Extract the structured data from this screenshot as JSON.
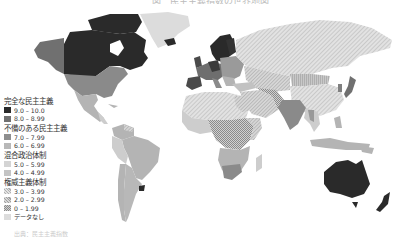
{
  "map": {
    "title": "図　民主主義指数の世界地図",
    "footer": "出典：民主主義指数",
    "colors": {
      "full_9_10": "#2a2a2a",
      "full_8_899": "#6e6e6e",
      "flawed_7_799": "#8e8e8e",
      "flawed_6_699": "#b4b4b4",
      "hybrid_5_599": "#cdcdcd",
      "hybrid_4_499": "#c2c2c2",
      "auth_3_399": "hatch-light",
      "auth_2_299": "hatch-medium",
      "auth_0_199": "hatch-dense",
      "no_data": "#dcdcdc"
    }
  },
  "legend": {
    "groups": [
      {
        "heading": "完全な民主主義",
        "items": [
          {
            "label": "9.0 – 10.0",
            "swatch": "#2a2a2a"
          },
          {
            "label": "8.0 – 8.99",
            "swatch": "#707070"
          }
        ]
      },
      {
        "heading": "不備のある民主主義",
        "items": [
          {
            "label": "7.0 – 7.99",
            "swatch": "#8e8e8e"
          },
          {
            "label": "6.0 – 6.99",
            "swatch": "#b8b8b8"
          }
        ]
      },
      {
        "heading": "混合政治体制",
        "items": [
          {
            "label": "5.0 – 5.99",
            "swatch": "#d4d4d4"
          },
          {
            "label": "4.0 – 4.99",
            "swatch": "#c4c4c4"
          }
        ]
      },
      {
        "heading": "権威主義体制",
        "items": [
          {
            "label": "3.0 – 3.99",
            "swatch": "hatch1"
          },
          {
            "label": "2.0 – 2.99",
            "swatch": "hatch2"
          },
          {
            "label": "0 – 1.99",
            "swatch": "hatch3"
          }
        ]
      }
    ],
    "no_data_label": "データなし"
  }
}
